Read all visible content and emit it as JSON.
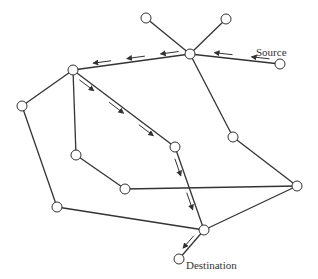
{
  "diagram": {
    "title": "",
    "labels": {
      "source": "Source",
      "destination": "Destination"
    },
    "colors": {
      "line": "#333333",
      "node_fill": "#ffffff",
      "background": "#ffffff"
    },
    "nodes": [
      {
        "id": "A",
        "x": 146,
        "y": 18
      },
      {
        "id": "B",
        "x": 226,
        "y": 19
      },
      {
        "id": "C",
        "x": 190,
        "y": 54
      },
      {
        "id": "S",
        "x": 280,
        "y": 64,
        "label": "Source"
      },
      {
        "id": "D",
        "x": 73,
        "y": 70
      },
      {
        "id": "E",
        "x": 22,
        "y": 106
      },
      {
        "id": "F",
        "x": 233,
        "y": 137
      },
      {
        "id": "G",
        "x": 76,
        "y": 155
      },
      {
        "id": "H",
        "x": 175,
        "y": 147
      },
      {
        "id": "I",
        "x": 125,
        "y": 189
      },
      {
        "id": "J",
        "x": 297,
        "y": 186
      },
      {
        "id": "K",
        "x": 57,
        "y": 207
      },
      {
        "id": "L",
        "x": 204,
        "y": 230
      },
      {
        "id": "T",
        "x": 179,
        "y": 259,
        "label": "Destination"
      }
    ],
    "edges": [
      [
        "A",
        "C"
      ],
      [
        "B",
        "C"
      ],
      [
        "S",
        "C"
      ],
      [
        "C",
        "D"
      ],
      [
        "C",
        "F"
      ],
      [
        "F",
        "J"
      ],
      [
        "D",
        "E"
      ],
      [
        "D",
        "G"
      ],
      [
        "D",
        "H"
      ],
      [
        "G",
        "I"
      ],
      [
        "I",
        "J"
      ],
      [
        "E",
        "K"
      ],
      [
        "K",
        "L"
      ],
      [
        "H",
        "L"
      ],
      [
        "J",
        "L"
      ],
      [
        "L",
        "T"
      ]
    ],
    "route": [
      "S",
      "C",
      "D",
      "H",
      "L",
      "T"
    ]
  }
}
